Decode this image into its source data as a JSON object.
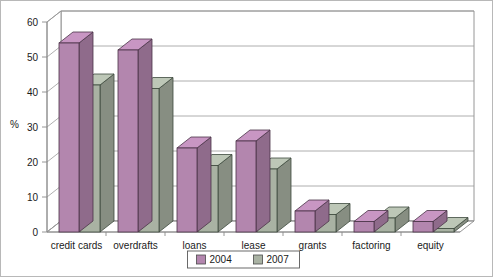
{
  "chart_data": {
    "type": "bar",
    "title": "",
    "subtitle": "",
    "xlabel": "",
    "ylabel": "%",
    "ylim": [
      0,
      60
    ],
    "yticks": [
      0,
      10,
      20,
      30,
      40,
      50,
      60
    ],
    "ytick_labels": [
      "0",
      "10",
      "20",
      "30",
      "40",
      "50",
      "60"
    ],
    "grid": true,
    "grid_axis": "y",
    "legend_position": "bottom-center",
    "style": "3d-bar",
    "categories": [
      "credit cards",
      "overdrafts",
      "loans",
      "lease",
      "grants",
      "factoring",
      "equity"
    ],
    "series": [
      {
        "name": "2004",
        "color": "#b386ae",
        "values": [
          54,
          52,
          24,
          26,
          6,
          3,
          3
        ]
      },
      {
        "name": "2007",
        "color": "#a9b2a3",
        "values": [
          42,
          41,
          19,
          18,
          5,
          4,
          1
        ]
      }
    ]
  },
  "axis": {
    "y_title": "%",
    "y_tick_labels": [
      "60",
      "50",
      "40",
      "30",
      "20",
      "10",
      "0"
    ]
  },
  "legend": {
    "items": [
      {
        "label": "2004",
        "color": "#b386ae"
      },
      {
        "label": "2007",
        "color": "#a9b2a3"
      }
    ]
  },
  "categories": [
    {
      "label": "credit cards"
    },
    {
      "label": "overdrafts"
    },
    {
      "label": "loans"
    },
    {
      "label": "lease"
    },
    {
      "label": "grants"
    },
    {
      "label": "factoring"
    },
    {
      "label": "equity"
    }
  ]
}
